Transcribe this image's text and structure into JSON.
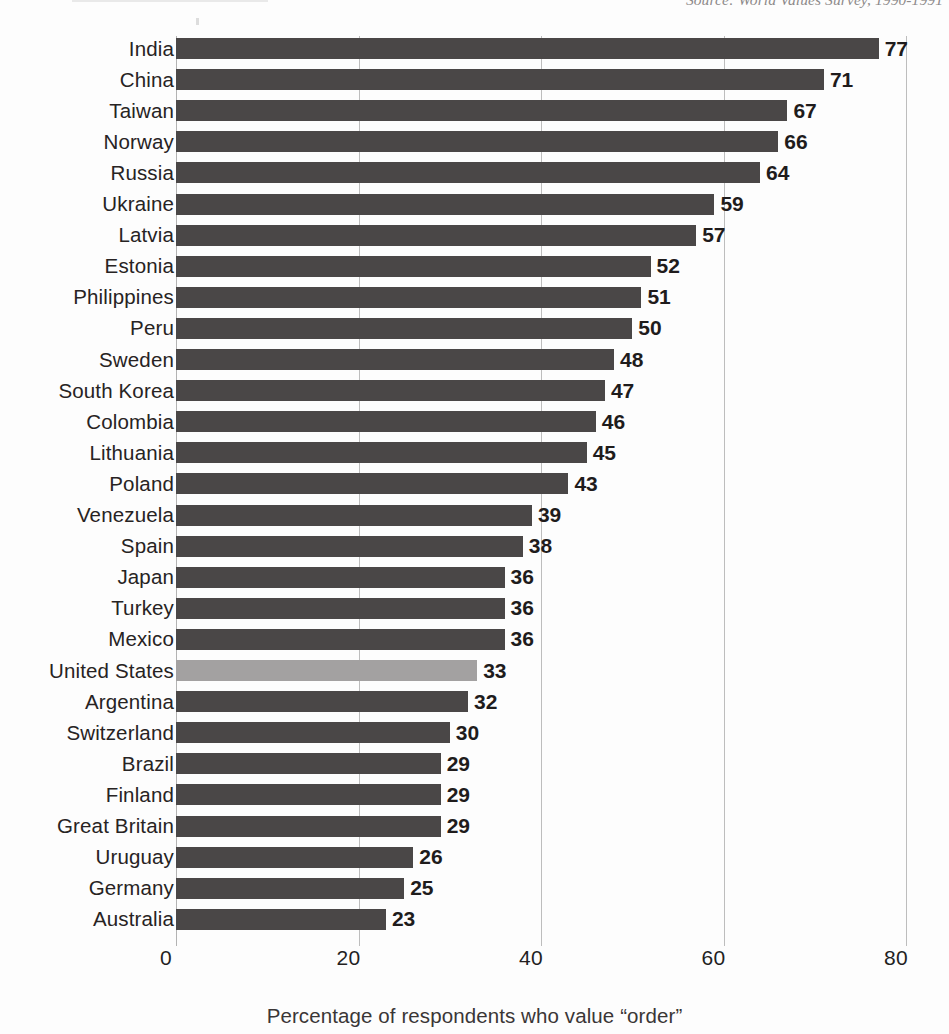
{
  "source_note": "Source: World Values Survey, 1990-1991",
  "chart_data": {
    "type": "bar",
    "orientation": "horizontal",
    "title": "",
    "xlabel": "Percentage of respondents who value “order”",
    "ylabel": "",
    "xlim": [
      0,
      80
    ],
    "xticks": [
      0,
      20,
      40,
      60,
      80
    ],
    "grid": true,
    "legend": "none",
    "highlight_category": "United States",
    "colors": {
      "bar": "#4a4747",
      "highlight_bar": "#a3a1a1",
      "gridline": "#bdbdbd",
      "text": "#231f1f",
      "background": "#fdfdfd"
    },
    "categories": [
      "India",
      "China",
      "Taiwan",
      "Norway",
      "Russia",
      "Ukraine",
      "Latvia",
      "Estonia",
      "Philippines",
      "Peru",
      "Sweden",
      "South Korea",
      "Colombia",
      "Lithuania",
      "Poland",
      "Venezuela",
      "Spain",
      "Japan",
      "Turkey",
      "Mexico",
      "United States",
      "Argentina",
      "Switzerland",
      "Brazil",
      "Finland",
      "Great Britain",
      "Uruguay",
      "Germany",
      "Australia"
    ],
    "values": [
      77,
      71,
      67,
      66,
      64,
      59,
      57,
      52,
      51,
      50,
      48,
      47,
      46,
      45,
      43,
      39,
      38,
      36,
      36,
      36,
      33,
      32,
      30,
      29,
      29,
      29,
      26,
      25,
      23
    ]
  }
}
